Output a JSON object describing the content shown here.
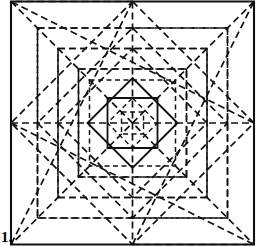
{
  "figure": {
    "label": "1.",
    "canvas": {
      "width": 266,
      "height": 246
    },
    "colors": {
      "ink": "#111111",
      "paper": "#ffffff"
    },
    "line_styles": {
      "solid": {
        "name": "cut-line",
        "dash": "none"
      },
      "dashed_long": {
        "name": "valley-fold-line",
        "dash": "7 4"
      },
      "dashed_short": {
        "name": "mountain-fold-line",
        "dash": "5 3.5"
      }
    },
    "geometry": {
      "frame": {
        "x": 11,
        "y": 8,
        "width": 243,
        "height": 230
      },
      "center": {
        "x": 132.5,
        "y": 123
      },
      "square_rings": [
        {
          "name": "ring-0-outer-frame",
          "half": 121.5,
          "style": "solid",
          "stroke": 2.1
        },
        {
          "name": "ring-1",
          "half": 95.0,
          "style": "dashed_long",
          "stroke": 1.7
        },
        {
          "name": "ring-2",
          "half": 74.5,
          "style": "dashed_long",
          "stroke": 1.7
        },
        {
          "name": "ring-3",
          "half": 54.0,
          "style": "dashed_long",
          "stroke": 1.7
        },
        {
          "name": "ring-4",
          "half": 43.0,
          "style": "dashed_short",
          "stroke": 1.5
        },
        {
          "name": "ring-5-inner-solid",
          "half": 25.0,
          "style": "solid",
          "stroke": 1.8
        },
        {
          "name": "ring-6-core",
          "half": 11.0,
          "style": "dashed_short",
          "stroke": 1.4
        }
      ],
      "diamond_rings": [
        {
          "name": "diamond-1",
          "radius": 121.5,
          "style": "dashed_long",
          "stroke": 1.7
        },
        {
          "name": "diamond-2",
          "radius": 95.0,
          "style": "dashed_long",
          "stroke": 1.7
        },
        {
          "name": "diamond-3",
          "radius": 74.5,
          "style": "dashed_long",
          "stroke": 1.7
        },
        {
          "name": "diamond-4-solid",
          "radius": 45.0,
          "style": "solid",
          "stroke": 1.9
        },
        {
          "name": "diamond-5",
          "radius": 25.0,
          "style": "dashed_short",
          "stroke": 1.4
        }
      ],
      "median_lines": {
        "name": "medians",
        "style": "dashed_long",
        "stroke": 1.7
      },
      "diagonal_lines": {
        "name": "corner-diagonals",
        "style": "dashed_long",
        "stroke": 1.7
      }
    }
  }
}
